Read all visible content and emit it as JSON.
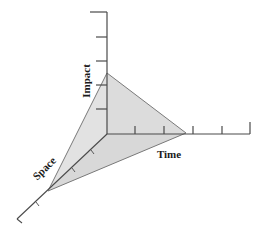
{
  "diagram": {
    "type": "3d-axes-with-plane",
    "axes": {
      "vertical": {
        "label": "Impact",
        "ticks": 5
      },
      "horizontal": {
        "label": "Time",
        "ticks": 5
      },
      "diagonal": {
        "label": "Space",
        "ticks": 4
      }
    },
    "plane": {
      "description": "Triangular plane intersecting all three axes",
      "fill": "#dcdcdc",
      "stroke": "#777777"
    },
    "colors": {
      "axis": "#4a4a4a",
      "plane_fill": "#dcdcdc",
      "label": "#1a1a1a",
      "background": "#ffffff"
    }
  }
}
